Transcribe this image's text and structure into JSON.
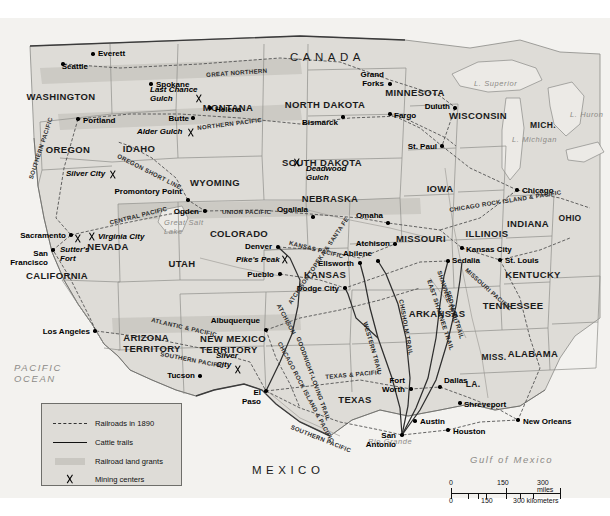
{
  "map": {
    "title": "Railroads and Cattle Trails of the American West, 1890",
    "countries": [
      {
        "name": "CANADA",
        "x": 290,
        "y": 34
      },
      {
        "name": "MEXICO",
        "x": 252,
        "y": 447
      }
    ],
    "waters": [
      {
        "name": "PACIFIC OCEAN",
        "lines": [
          "PACIFIC",
          "OCEAN"
        ],
        "x": 14,
        "y": 345
      },
      {
        "name": "Gulf of Mexico",
        "x": 470,
        "y": 437
      },
      {
        "name": "L. Superior",
        "x": 474,
        "y": 62
      },
      {
        "name": "L. Michigan",
        "x": 512,
        "y": 118
      },
      {
        "name": "L. Huron",
        "x": 570,
        "y": 93
      },
      {
        "name": "Great Salt Lake",
        "lines": [
          "Great Salt",
          "Lake"
        ],
        "x": 164,
        "y": 201
      },
      {
        "name": "Rio Grande",
        "x": 368,
        "y": 420
      }
    ],
    "states": [
      {
        "name": "WASHINGTON",
        "x": 61,
        "y": 74
      },
      {
        "name": "OREGON",
        "x": 68,
        "y": 127
      },
      {
        "name": "IDAHO",
        "x": 139,
        "y": 126
      },
      {
        "name": "MONTANA",
        "x": 228,
        "y": 85
      },
      {
        "name": "NORTH DAKOTA",
        "x": 325,
        "y": 82
      },
      {
        "name": "SOUTH DAKOTA",
        "x": 322,
        "y": 140
      },
      {
        "name": "MINNESOTA",
        "x": 415,
        "y": 70
      },
      {
        "name": "WISCONSIN",
        "x": 478,
        "y": 93
      },
      {
        "name": "MICH.",
        "x": 543,
        "y": 103
      },
      {
        "name": "WYOMING",
        "x": 215,
        "y": 160
      },
      {
        "name": "NEBRASKA",
        "x": 330,
        "y": 176
      },
      {
        "name": "IOWA",
        "x": 440,
        "y": 166
      },
      {
        "name": "ILLINOIS",
        "x": 487,
        "y": 211
      },
      {
        "name": "INDIANA",
        "x": 528,
        "y": 201
      },
      {
        "name": "OHIO",
        "x": 570,
        "y": 196
      },
      {
        "name": "NEVADA",
        "x": 108,
        "y": 224
      },
      {
        "name": "UTAH",
        "x": 182,
        "y": 241
      },
      {
        "name": "COLORADO",
        "x": 239,
        "y": 211
      },
      {
        "name": "KANSAS",
        "x": 325,
        "y": 252
      },
      {
        "name": "MISSOURI",
        "x": 421,
        "y": 216
      },
      {
        "name": "KENTUCKY",
        "x": 533,
        "y": 252
      },
      {
        "name": "CALIFORNIA",
        "x": 57,
        "y": 253
      },
      {
        "name": "ARIZONA TERRITORY",
        "lines": [
          "ARIZONA",
          "TERRITORY"
        ],
        "x": 152,
        "y": 315
      },
      {
        "name": "NEW MEXICO TERRITORY",
        "lines": [
          "NEW MEXICO",
          "TERRITORY"
        ],
        "x": 233,
        "y": 316
      },
      {
        "name": "ARKANSAS",
        "x": 437,
        "y": 291
      },
      {
        "name": "TENNESSEE",
        "x": 513,
        "y": 283
      },
      {
        "name": "MISS.",
        "x": 494,
        "y": 335
      },
      {
        "name": "ALABAMA",
        "x": 533,
        "y": 331
      },
      {
        "name": "LA.",
        "x": 473,
        "y": 362
      },
      {
        "name": "TEXAS",
        "x": 355,
        "y": 377
      }
    ],
    "cities": [
      {
        "name": "Seattle",
        "x": 63,
        "y": 46,
        "dx": 25,
        "dy": 3,
        "anchor": "right"
      },
      {
        "name": "Everett",
        "x": 93,
        "y": 36,
        "dx": 5,
        "dy": 0,
        "anchor": "left"
      },
      {
        "name": "Spokane",
        "x": 151,
        "y": 66,
        "dx": 5,
        "dy": 1,
        "anchor": "left"
      },
      {
        "name": "Portland",
        "x": 78,
        "y": 101,
        "dx": 5,
        "dy": 2,
        "anchor": "left"
      },
      {
        "name": "Butte",
        "x": 193,
        "y": 100,
        "dx": -4,
        "dy": 1,
        "anchor": "right"
      },
      {
        "name": "Helena",
        "x": 210,
        "y": 90,
        "dx": 5,
        "dy": 2,
        "anchor": "left"
      },
      {
        "name": "Bismarck",
        "x": 343,
        "y": 99,
        "dx": -5,
        "dy": 6,
        "anchor": "right"
      },
      {
        "name": "Fargo",
        "x": 390,
        "y": 96,
        "dx": 4,
        "dy": 2,
        "anchor": "left"
      },
      {
        "name": "Grand Forks",
        "lines": [
          "Grand",
          "Forks"
        ],
        "x": 390,
        "y": 66,
        "dx": -6,
        "dy": -9,
        "anchor": "right"
      },
      {
        "name": "Duluth",
        "x": 455,
        "y": 90,
        "dx": -5,
        "dy": -1,
        "anchor": "right"
      },
      {
        "name": "St. Paul",
        "x": 442,
        "y": 128,
        "dx": -5,
        "dy": 1,
        "anchor": "right"
      },
      {
        "name": "Chicago",
        "x": 517,
        "y": 172,
        "dx": 5,
        "dy": 1,
        "anchor": "left"
      },
      {
        "name": "Promontory Point",
        "x": 188,
        "y": 182,
        "dx": -6,
        "dy": -8,
        "anchor": "right"
      },
      {
        "name": "Ogden",
        "x": 205,
        "y": 193,
        "dx": -6,
        "dy": 1,
        "anchor": "right"
      },
      {
        "name": "Sacramento",
        "x": 71,
        "y": 217,
        "dx": -5,
        "dy": 1,
        "anchor": "right"
      },
      {
        "name": "San Francisco",
        "lines": [
          "San",
          "Francisco"
        ],
        "x": 53,
        "y": 232,
        "dx": -5,
        "dy": 4,
        "anchor": "right"
      },
      {
        "name": "Denver",
        "x": 278,
        "y": 229,
        "dx": -6,
        "dy": 0,
        "anchor": "right"
      },
      {
        "name": "Pueblo",
        "x": 280,
        "y": 256,
        "dx": -6,
        "dy": 1,
        "anchor": "right"
      },
      {
        "name": "Ogallala",
        "x": 313,
        "y": 199,
        "dx": -5,
        "dy": -7,
        "anchor": "right"
      },
      {
        "name": "Omaha",
        "x": 388,
        "y": 205,
        "dx": -5,
        "dy": -7,
        "anchor": "right"
      },
      {
        "name": "Atchison",
        "x": 395,
        "y": 226,
        "dx": -5,
        "dy": 0,
        "anchor": "right"
      },
      {
        "name": "Abilene",
        "x": 378,
        "y": 243,
        "dx": -6,
        "dy": -7,
        "anchor": "right"
      },
      {
        "name": "Ellsworth",
        "x": 360,
        "y": 245,
        "dx": -6,
        "dy": 1,
        "anchor": "right"
      },
      {
        "name": "Dodge City",
        "x": 345,
        "y": 270,
        "dx": -6,
        "dy": 1,
        "anchor": "right"
      },
      {
        "name": "Kansas City",
        "x": 462,
        "y": 230,
        "dx": 4,
        "dy": 2,
        "anchor": "left"
      },
      {
        "name": "Sedalia",
        "x": 448,
        "y": 243,
        "dx": 4,
        "dy": 0,
        "anchor": "left"
      },
      {
        "name": "St. Louis",
        "x": 500,
        "y": 242,
        "dx": 5,
        "dy": 1,
        "anchor": "left"
      },
      {
        "name": "Los Angeles",
        "x": 95,
        "y": 313,
        "dx": -5,
        "dy": 1,
        "anchor": "right"
      },
      {
        "name": "Tucson",
        "x": 200,
        "y": 358,
        "dx": -5,
        "dy": 0,
        "anchor": "right"
      },
      {
        "name": "Albuquerque",
        "x": 266,
        "y": 312,
        "dx": -6,
        "dy": -9,
        "anchor": "right"
      },
      {
        "name": "El Paso",
        "lines": [
          "El",
          "Paso"
        ],
        "x": 266,
        "y": 373,
        "dx": -5,
        "dy": 2,
        "anchor": "right"
      },
      {
        "name": "Fort Worth",
        "lines": [
          "Fort",
          "Worth"
        ],
        "x": 411,
        "y": 371,
        "dx": -6,
        "dy": -8,
        "anchor": "right"
      },
      {
        "name": "Dallas",
        "x": 440,
        "y": 369,
        "dx": 4,
        "dy": -6,
        "anchor": "left"
      },
      {
        "name": "Shreveport",
        "x": 460,
        "y": 385,
        "dx": 4,
        "dy": 2,
        "anchor": "left"
      },
      {
        "name": "Austin",
        "x": 415,
        "y": 403,
        "dx": 5,
        "dy": 1,
        "anchor": "left"
      },
      {
        "name": "San Antonio",
        "lines": [
          "San",
          "Antonio"
        ],
        "x": 402,
        "y": 417,
        "dx": -6,
        "dy": 1,
        "anchor": "right"
      },
      {
        "name": "Houston",
        "x": 448,
        "y": 412,
        "dx": 5,
        "dy": 2,
        "anchor": "left"
      },
      {
        "name": "New Orleans",
        "x": 518,
        "y": 402,
        "dx": 5,
        "dy": 2,
        "anchor": "left"
      }
    ],
    "mining_centers": [
      {
        "name": "Last Chance Gulch",
        "lines": [
          "Last Chance",
          "Gulch"
        ],
        "x": 199,
        "y": 80,
        "tx": 150,
        "ty": 68
      },
      {
        "name": "Alder Gulch",
        "x": 191,
        "y": 114,
        "tx": 137,
        "ty": 110
      },
      {
        "name": "Deadwood Gulch",
        "lines": [
          "Deadwood",
          "Gulch"
        ],
        "x": 297,
        "y": 144,
        "tx": 306,
        "ty": 147
      },
      {
        "name": "Silver City",
        "x": 113,
        "y": 156,
        "tx": 66,
        "ty": 152
      },
      {
        "name": "Virginia City",
        "x": 92,
        "y": 218,
        "tx": 98,
        "ty": 215
      },
      {
        "name": "Sutter's Fort",
        "lines": [
          "Sutter's",
          "Fort"
        ],
        "x": 78,
        "y": 220,
        "tx": 60,
        "ty": 228
      },
      {
        "name": "Pike's Peak",
        "x": 285,
        "y": 241,
        "tx": 236,
        "ty": 238
      },
      {
        "name": "Silver City (NM)",
        "lines": [
          "Silver",
          "City"
        ],
        "x": 238,
        "y": 351,
        "tx": 216,
        "ty": 334
      }
    ],
    "railroads": [
      {
        "name": "GREAT NORTHERN",
        "x": 206,
        "y": 54,
        "rot": -4
      },
      {
        "name": "NORTHERN PACIFIC",
        "x": 197,
        "y": 107,
        "rot": -7
      },
      {
        "name": "SOUTHERN PACIFIC",
        "x": 28,
        "y": 160,
        "rot": -72
      },
      {
        "name": "OREGON SHORT LINE",
        "x": 119,
        "y": 135,
        "rot": 27
      },
      {
        "name": "CENTRAL PACIFIC",
        "x": 109,
        "y": 202,
        "rot": -14
      },
      {
        "name": "UNION PACIFIC",
        "x": 222,
        "y": 191,
        "rot": 0
      },
      {
        "name": "KANSAS PACIFIC",
        "x": 290,
        "y": 222,
        "rot": 14
      },
      {
        "name": "ATCHISON TOPEKA & SANTA FE",
        "x": 287,
        "y": 284,
        "rot": -56
      },
      {
        "name": "CHICAGO ROCK ISLAND & PACIFIC",
        "x": 449,
        "y": 189,
        "rot": -9
      },
      {
        "name": "MISSOURI PACIFIC",
        "x": 468,
        "y": 249,
        "rot": 42
      },
      {
        "name": "ATLANTIC & PACIFIC",
        "x": 152,
        "y": 299,
        "rot": 13
      },
      {
        "name": "SOUTHERN PACIFIC (SW)",
        "label": "SOUTHERN PACIFIC",
        "x": 161,
        "y": 333,
        "rot": 11
      },
      {
        "name": "CHICAGO ROCK ISLAND & PACIFIC (SW)",
        "label": "CHICAGO ROCK ISLAND & PACIFIC",
        "x": 282,
        "y": 323,
        "rot": 62
      },
      {
        "name": "TEXAS & PACIFIC",
        "x": 325,
        "y": 356,
        "rot": -5
      },
      {
        "name": "SOUTHERN PACIFIC (TX)",
        "label": "SOUTHERN PACIFIC",
        "x": 292,
        "y": 406,
        "rot": 22
      },
      {
        "name": "ATCHISON TOPEKA & SANTA FE (NM)",
        "label": "ATCHISON",
        "x": 281,
        "y": 285,
        "rot": 62
      }
    ],
    "cattle_trails": [
      {
        "name": "WESTERN TRAIL",
        "x": 368,
        "y": 303,
        "rot": 74
      },
      {
        "name": "CHISHOLM TRAIL",
        "x": 404,
        "y": 281,
        "rot": 80
      },
      {
        "name": "EAST SHAWNEE TRAIL",
        "x": 432,
        "y": 261,
        "rot": 72
      },
      {
        "name": "SHAWNEE TRAIL",
        "x": 442,
        "y": 252,
        "rot": 72
      },
      {
        "name": "SEDALIA TRAIL",
        "x": 451,
        "y": 272,
        "rot": 74
      },
      {
        "name": "GOODNIGHT-LOVING TRAIL",
        "x": 301,
        "y": 318,
        "rot": 70
      }
    ],
    "legend": {
      "items": [
        {
          "key": "railroad-line",
          "label": "Railroads in 1890"
        },
        {
          "key": "cattle-trail-line",
          "label": "Cattle trails"
        },
        {
          "key": "land-grant-swatch",
          "label": "Railroad land grants"
        },
        {
          "key": "mining-pick-icon",
          "label": "Mining centers"
        }
      ]
    },
    "scale": {
      "miles": {
        "ticks": [
          "0",
          "150",
          "300 miles"
        ]
      },
      "kilometers": {
        "ticks": [
          "0",
          "150",
          "300 kilometers"
        ]
      }
    },
    "colors": {
      "land": "#dedcd7",
      "ocean": "#f3f2ef",
      "grant": "#c9c7c1",
      "line": "#3b3b3b",
      "water_text": "#8d8b87"
    }
  }
}
